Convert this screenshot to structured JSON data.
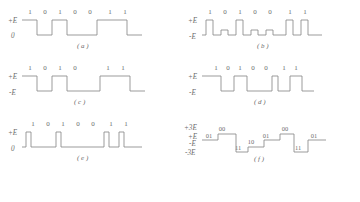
{
  "figure": {
    "stroke_color": "#8a8a8a",
    "text_color": "#6b6b6b",
    "background": "#ffffff"
  },
  "panels": [
    {
      "id": "a",
      "caption": "( a )",
      "scheme": "unipolar-nrz",
      "levels": [
        "+E",
        "0"
      ],
      "bits": [
        "1",
        "0",
        "1",
        "0",
        "0",
        "1",
        "1"
      ],
      "bit_x": [
        30,
        45,
        60,
        75,
        90,
        110,
        125
      ],
      "level_y": {
        "high": 18,
        "low": 33
      },
      "path": "M 22 18 L 37 18 L 37 33 L 52 33 L 52 18 L 67 18 L 67 33 L 97 33 L 97 18 L 127 18 L 127 33 L 142 33"
    },
    {
      "id": "b",
      "caption": "( b )",
      "scheme": "bipolar-rz",
      "levels": [
        "+E",
        "-E"
      ],
      "bits": [
        "1",
        "0",
        "1",
        "0",
        "0",
        "1",
        "1"
      ],
      "bit_x": [
        30,
        45,
        60,
        75,
        90,
        110,
        125
      ],
      "level_y": {
        "high": 18,
        "low": 33
      },
      "path": "M 22 33 L 26 33 L 26 18 L 33 18 L 33 33 L 41 33 L 41 28 L 48 28 L 48 33 L 56 33 L 56 18 L 63 18 L 63 33 L 71 33 L 71 28 L 78 28 L 78 33 L 86 33 L 86 28 L 93 28 L 93 33 L 106 33 L 106 18 L 113 18 L 113 33 L 121 33 L 121 18 L 128 18 L 128 33 L 142 33"
    },
    {
      "id": "c",
      "caption": "( c )",
      "scheme": "polar-nrz-variant",
      "levels": [
        "+E",
        "-E"
      ],
      "bits": [
        "1",
        "0",
        "1",
        "0",
        "1",
        "1"
      ],
      "bit_x": [
        30,
        45,
        60,
        75,
        108,
        123
      ],
      "level_y": {
        "high": 18,
        "low": 33
      },
      "path": "M 22 18 L 37 18 L 37 33 L 52 33 L 52 18 L 67 18 L 67 33 L 100 33 L 100 18 L 130 18 L 130 33 L 145 33"
    },
    {
      "id": "d",
      "caption": "( d )",
      "scheme": "polar-nrz",
      "levels": [
        "+E",
        "-E"
      ],
      "bits": [
        "1",
        "0",
        "1",
        "0",
        "0",
        "1",
        "1"
      ],
      "bit_x": [
        36,
        48,
        60,
        73,
        86,
        104,
        116
      ],
      "level_y": {
        "high": 18,
        "low": 33
      },
      "path": "M 22 18 L 41 18 L 41 33 L 54 33 L 54 18 L 67 18 L 67 33 L 92 33 L 92 18 L 98 18 L 98 33 L 110 33 L 110 18 L 122 18 L 122 33 L 134 33"
    },
    {
      "id": "e",
      "caption": "( e )",
      "scheme": "unipolar-rz",
      "levels": [
        "+E",
        "0"
      ],
      "bits": [
        "1",
        "0",
        "1",
        "0",
        "0",
        "1",
        "1"
      ],
      "bit_x": [
        33,
        48,
        63,
        78,
        93,
        111,
        126
      ],
      "level_y": {
        "high": 18,
        "low": 33
      },
      "path": "M 22 33 L 26 33 L 26 18 L 31 18 L 31 33 L 56 33 L 56 18 L 61 18 L 61 33 L 104 33 L 104 18 L 109 18 L 109 33 L 119 33 L 119 18 L 124 18 L 124 33 L 142 33"
    },
    {
      "id": "f",
      "caption": "( f )",
      "scheme": "quaternary-4-level",
      "levels": [
        "+3E",
        "+E",
        "-E",
        "-3E"
      ],
      "dibits": [
        "01",
        "00",
        "11",
        "10",
        "01",
        "00",
        "01"
      ],
      "dibit_pos": [
        {
          "t": "01",
          "x": 29,
          "y": 24
        },
        {
          "t": "00",
          "x": 42,
          "y": 17
        },
        {
          "t": "11",
          "x": 58,
          "y": 36
        },
        {
          "t": "10",
          "x": 71,
          "y": 30
        },
        {
          "t": "01",
          "x": 86,
          "y": 24
        },
        {
          "t": "00",
          "x": 105,
          "y": 17
        },
        {
          "t": "11",
          "x": 118,
          "y": 36
        },
        {
          "t": "01",
          "x": 134,
          "y": 24
        }
      ],
      "level_y": {
        "p3": 13,
        "p1": 22,
        "m1": 29,
        "m3": 38
      },
      "path": "M 22 26 L 38 26 L 38 20 L 56 20 L 56 38 L 68 38 L 68 33 L 84 33 L 84 26 L 100 26 L 100 20 L 114 20 L 114 38 L 128 38 L 128 26 L 146 26"
    }
  ],
  "axis_labels": {
    "plus_e": "+E",
    "zero": "0",
    "minus_e": "-E",
    "plus_3e": "+3E",
    "minus_3e": "-3E"
  }
}
